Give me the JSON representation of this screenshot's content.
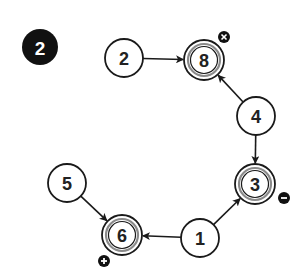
{
  "step_badge": {
    "label": "2",
    "cx": 40,
    "cy": 47,
    "r": 18
  },
  "colors": {
    "stroke": "#1a1a1a",
    "inner_ring": "#8a8a8a",
    "badge_fill": "#111111",
    "badge_text": "#ffffff",
    "node_fill": "#ffffff"
  },
  "nodes": [
    {
      "id": "2",
      "label": "2",
      "cx": 124,
      "cy": 58,
      "r": 19,
      "double": false
    },
    {
      "id": "8",
      "label": "8",
      "cx": 204,
      "cy": 60,
      "r": 20,
      "double": true
    },
    {
      "id": "4",
      "label": "4",
      "cx": 256,
      "cy": 116,
      "r": 19,
      "double": false
    },
    {
      "id": "3",
      "label": "3",
      "cx": 255,
      "cy": 184,
      "r": 20,
      "double": true
    },
    {
      "id": "1",
      "label": "1",
      "cx": 200,
      "cy": 238,
      "r": 19,
      "double": false
    },
    {
      "id": "6",
      "label": "6",
      "cx": 122,
      "cy": 235,
      "r": 20,
      "double": true
    },
    {
      "id": "5",
      "label": "5",
      "cx": 67,
      "cy": 183,
      "r": 19,
      "double": false
    }
  ],
  "edges": [
    {
      "from": "2",
      "to": "8"
    },
    {
      "from": "4",
      "to": "8"
    },
    {
      "from": "4",
      "to": "3"
    },
    {
      "from": "1",
      "to": "3"
    },
    {
      "from": "1",
      "to": "6"
    },
    {
      "from": "5",
      "to": "6"
    }
  ],
  "markers": [
    {
      "node": "8",
      "type": "remove",
      "glyph": "×",
      "cx": 224,
      "cy": 37,
      "r": 6
    },
    {
      "node": "3",
      "type": "minus",
      "glyph": "−",
      "cx": 284,
      "cy": 198,
      "r": 6
    },
    {
      "node": "6",
      "type": "plus",
      "glyph": "+",
      "cx": 104,
      "cy": 261,
      "r": 6
    }
  ]
}
